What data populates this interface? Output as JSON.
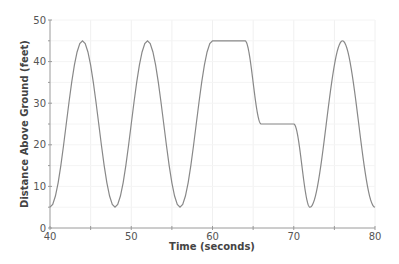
{
  "chart_data": {
    "type": "line",
    "title": "",
    "xlabel": "Time (seconds)",
    "ylabel": "Distance Above Ground (feet)",
    "xlim": [
      40,
      80
    ],
    "ylim": [
      0,
      50
    ],
    "x_ticks": [
      40,
      50,
      60,
      70,
      80
    ],
    "y_ticks": [
      0,
      10,
      20,
      30,
      40,
      50
    ],
    "grid": true,
    "legend": null,
    "series": [
      {
        "name": "height",
        "color": "#888888",
        "segments": [
          {
            "kind": "cosine",
            "t_start": 40,
            "t_end": 60,
            "center": 25,
            "amplitude": 20,
            "period": 8,
            "phase_t": 40,
            "note": "h = 25 - 20cos(2π(t-40)/8): min 5 at 40,48,56; max 45 at 44,52,60"
          },
          {
            "kind": "flat",
            "t_start": 60,
            "t_end": 64,
            "value": 45
          },
          {
            "kind": "half-cosine",
            "t_start": 64,
            "t_end": 66,
            "from": 45,
            "to": 25
          },
          {
            "kind": "flat",
            "t_start": 66,
            "t_end": 70,
            "value": 25
          },
          {
            "kind": "half-cosine",
            "t_start": 70,
            "t_end": 72,
            "from": 25,
            "to": 5
          },
          {
            "kind": "cosine",
            "t_start": 72,
            "t_end": 80,
            "center": 25,
            "amplitude": 20,
            "period": 8,
            "phase_t": 72,
            "note": "min 5 at 72 and 80, max 45 at 76"
          }
        ],
        "key_points": [
          {
            "x": 40,
            "y": 5
          },
          {
            "x": 44,
            "y": 45
          },
          {
            "x": 48,
            "y": 5
          },
          {
            "x": 52,
            "y": 45
          },
          {
            "x": 56,
            "y": 5
          },
          {
            "x": 60,
            "y": 45
          },
          {
            "x": 64,
            "y": 45
          },
          {
            "x": 66,
            "y": 25
          },
          {
            "x": 70,
            "y": 25
          },
          {
            "x": 72,
            "y": 5
          },
          {
            "x": 76,
            "y": 45
          },
          {
            "x": 80,
            "y": 5
          }
        ]
      }
    ]
  },
  "layout": {
    "plot_left": 50,
    "plot_right": 375,
    "plot_top": 20,
    "plot_bottom": 228
  }
}
